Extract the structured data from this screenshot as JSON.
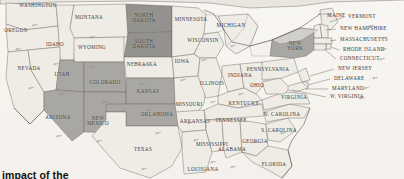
{
  "map": {
    "title": "United States map with selected states shaded",
    "projection": "antique-sepia",
    "colors": {
      "background": "#f7f5f1",
      "land_default": "#efece6",
      "land_highlight": "#a9a7a3",
      "land_highlight_dark": "#94928e",
      "border": "#6e6a64",
      "coast": "#57534d",
      "water": "#f2f0ec",
      "label_text": "#39342f",
      "caption_text": "#111111"
    },
    "caption": "impact of the"
  },
  "legend_note": "Darker gray fill marks highlighted states",
  "states": [
    {
      "code": "WA",
      "label": "WASHINGTON",
      "x": 38,
      "y": 6,
      "highlight": false,
      "lines": 1
    },
    {
      "code": "OR",
      "label": "OREGON",
      "x": 16,
      "y": 31,
      "highlight": false,
      "lines": 1
    },
    {
      "code": "ID",
      "label": "IDAHO",
      "x": 55,
      "y": 45,
      "highlight": false,
      "lines": 1
    },
    {
      "code": "MT",
      "label": "MONTANA",
      "x": 89,
      "y": 18,
      "highlight": false,
      "lines": 1
    },
    {
      "code": "ND",
      "label": "NORTH\nDAKOTA",
      "x": 144,
      "y": 18,
      "highlight": true,
      "lines": 2
    },
    {
      "code": "MN",
      "label": "MINNESOTA",
      "x": 191,
      "y": 20,
      "highlight": false,
      "lines": 1
    },
    {
      "code": "SD",
      "label": "SOUTH\nDAKOTA",
      "x": 144,
      "y": 44,
      "highlight": true,
      "lines": 2
    },
    {
      "code": "WY",
      "label": "WYOMING",
      "x": 92,
      "y": 48,
      "highlight": false,
      "lines": 1
    },
    {
      "code": "NV",
      "label": "NEVADA",
      "x": 29,
      "y": 69,
      "highlight": false,
      "lines": 1
    },
    {
      "code": "UT",
      "label": "UTAH",
      "x": 62,
      "y": 75,
      "highlight": true,
      "lines": 1
    },
    {
      "code": "CO",
      "label": "COLORADO",
      "x": 105,
      "y": 83,
      "highlight": true,
      "lines": 1
    },
    {
      "code": "NE",
      "label": "NEBRASKA",
      "x": 142,
      "y": 65,
      "highlight": false,
      "lines": 1
    },
    {
      "code": "IA",
      "label": "IOWA",
      "x": 182,
      "y": 62,
      "highlight": false,
      "lines": 1
    },
    {
      "code": "WI",
      "label": "WISCONSIN",
      "x": 203,
      "y": 41,
      "highlight": false,
      "lines": 1
    },
    {
      "code": "MI",
      "label": "MICHIGAN",
      "x": 231,
      "y": 26,
      "highlight": false,
      "lines": 1
    },
    {
      "code": "IL",
      "label": "ILLINOIS",
      "x": 212,
      "y": 84,
      "highlight": false,
      "lines": 1
    },
    {
      "code": "IN",
      "label": "INDIANA",
      "x": 240,
      "y": 76,
      "highlight": false,
      "lines": 1
    },
    {
      "code": "OH",
      "label": "OHIO",
      "x": 257,
      "y": 86,
      "highlight": false,
      "lines": 1
    },
    {
      "code": "MO",
      "label": "MISSOURI",
      "x": 189,
      "y": 105,
      "highlight": false,
      "lines": 1
    },
    {
      "code": "KS",
      "label": "KANSAS",
      "x": 148,
      "y": 92,
      "highlight": true,
      "lines": 1
    },
    {
      "code": "OK",
      "label": "OKLAHOMA",
      "x": 157,
      "y": 115,
      "highlight": true,
      "lines": 1
    },
    {
      "code": "AZ",
      "label": "ARIZONA",
      "x": 58,
      "y": 118,
      "highlight": true,
      "lines": 1
    },
    {
      "code": "NM",
      "label": "NEW\nMEXICO",
      "x": 98,
      "y": 121,
      "highlight": true,
      "lines": 2
    },
    {
      "code": "TX",
      "label": "TEXAS",
      "x": 143,
      "y": 150,
      "highlight": false,
      "lines": 1
    },
    {
      "code": "AR",
      "label": "ARKANSAS",
      "x": 195,
      "y": 122,
      "highlight": false,
      "lines": 1
    },
    {
      "code": "LA",
      "label": "LOUISIANA",
      "x": 203,
      "y": 170,
      "highlight": false,
      "lines": 1
    },
    {
      "code": "TN",
      "label": "TENNESSEE",
      "x": 231,
      "y": 121,
      "highlight": false,
      "lines": 1
    },
    {
      "code": "KY",
      "label": "KENTUCKY",
      "x": 244,
      "y": 104,
      "highlight": false,
      "lines": 1
    },
    {
      "code": "MS",
      "label": "MISSISSIPPI",
      "x": 212,
      "y": 145,
      "highlight": false,
      "lines": 1
    },
    {
      "code": "AL",
      "label": "ALABAMA",
      "x": 232,
      "y": 150,
      "highlight": false,
      "lines": 1
    },
    {
      "code": "GA",
      "label": "GEORGIA",
      "x": 255,
      "y": 142,
      "highlight": false,
      "lines": 1
    },
    {
      "code": "FL",
      "label": "FLORIDA",
      "x": 274,
      "y": 165,
      "highlight": false,
      "lines": 1
    },
    {
      "code": "SC",
      "label": "S. CAROLINA",
      "x": 279,
      "y": 131,
      "highlight": false,
      "lines": 1
    },
    {
      "code": "NC",
      "label": "N. CAROLINA",
      "x": 282,
      "y": 115,
      "highlight": false,
      "lines": 1
    },
    {
      "code": "VA",
      "label": "VIRGINIA",
      "x": 294,
      "y": 98,
      "highlight": false,
      "lines": 1
    },
    {
      "code": "PA",
      "label": "PENNSYLVANIA",
      "x": 268,
      "y": 70,
      "highlight": false,
      "lines": 1
    },
    {
      "code": "NY",
      "label": "NEW\nYORK",
      "x": 295,
      "y": 46,
      "highlight": true,
      "lines": 2
    }
  ],
  "callouts": [
    {
      "code": "ME",
      "label": "MAINE",
      "x": 327,
      "y": 16
    },
    {
      "code": "VT",
      "label": "VERMONT",
      "x": 348,
      "y": 17
    },
    {
      "code": "NH",
      "label": "NEW HAMPSHIRE",
      "x": 340,
      "y": 29
    },
    {
      "code": "MA",
      "label": "MASSACHUSETTS",
      "x": 340,
      "y": 40
    },
    {
      "code": "RI",
      "label": "RHODE ISLAND",
      "x": 343,
      "y": 50
    },
    {
      "code": "CT",
      "label": "CONNECTICUT",
      "x": 340,
      "y": 59
    },
    {
      "code": "NJ",
      "label": "NEW JERSEY",
      "x": 338,
      "y": 69
    },
    {
      "code": "DE",
      "label": "DELAWARE",
      "x": 334,
      "y": 79
    },
    {
      "code": "MD",
      "label": "MARYLAND",
      "x": 332,
      "y": 89
    },
    {
      "code": "WV",
      "label": "W. VIRGINIA",
      "x": 330,
      "y": 97
    }
  ],
  "birds": [
    {
      "x": 35,
      "y": 16
    },
    {
      "x": 18,
      "y": 40
    },
    {
      "x": 56,
      "y": 55
    },
    {
      "x": 92,
      "y": 28
    },
    {
      "x": 145,
      "y": 30
    },
    {
      "x": 145,
      "y": 56
    },
    {
      "x": 92,
      "y": 58
    },
    {
      "x": 31,
      "y": 79
    },
    {
      "x": 62,
      "y": 85
    },
    {
      "x": 105,
      "y": 93
    },
    {
      "x": 142,
      "y": 75
    },
    {
      "x": 183,
      "y": 71
    },
    {
      "x": 204,
      "y": 51
    },
    {
      "x": 233,
      "y": 37
    },
    {
      "x": 213,
      "y": 93
    },
    {
      "x": 241,
      "y": 85
    },
    {
      "x": 258,
      "y": 95
    },
    {
      "x": 190,
      "y": 114
    },
    {
      "x": 149,
      "y": 101
    },
    {
      "x": 158,
      "y": 124
    },
    {
      "x": 59,
      "y": 127
    },
    {
      "x": 99,
      "y": 132
    },
    {
      "x": 144,
      "y": 160
    },
    {
      "x": 196,
      "y": 131
    },
    {
      "x": 213,
      "y": 153
    },
    {
      "x": 233,
      "y": 158
    },
    {
      "x": 256,
      "y": 133
    },
    {
      "x": 283,
      "y": 124
    },
    {
      "x": 371,
      "y": 17
    },
    {
      "x": 384,
      "y": 29
    },
    {
      "x": 384,
      "y": 40
    },
    {
      "x": 382,
      "y": 50
    },
    {
      "x": 375,
      "y": 69
    },
    {
      "x": 366,
      "y": 79
    },
    {
      "x": 362,
      "y": 89
    }
  ]
}
